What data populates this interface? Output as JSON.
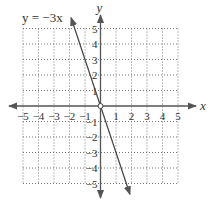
{
  "chart_data": {
    "type": "line",
    "title": "",
    "equation_label": "y = −3x",
    "xlabel": "x",
    "ylabel": "y",
    "xlim": [
      -5,
      5
    ],
    "ylim": [
      -5,
      5
    ],
    "grid": true,
    "grid_style": "dotted",
    "x_ticks": [
      -5,
      -4,
      -3,
      -2,
      -1,
      1,
      2,
      3,
      4,
      5
    ],
    "y_ticks": [
      5,
      4,
      3,
      2,
      1,
      -1,
      -2,
      -3,
      -4,
      -5
    ],
    "x_tick_labels": [
      "−5",
      "−4",
      "−3",
      "−2",
      "−1",
      "1",
      "2",
      "3",
      "4",
      "5"
    ],
    "y_tick_labels": [
      "5",
      "4",
      "3",
      "2",
      "1",
      "−1",
      "−2",
      "−3",
      "−4",
      "−5"
    ],
    "series": [
      {
        "name": "y = −3x",
        "slope": -3,
        "intercept": 0,
        "x": [
          -1.9,
          0,
          1.9
        ],
        "y": [
          5.7,
          0,
          -5.7
        ],
        "arrows_both_ends": true
      }
    ],
    "marked_points": [
      {
        "x": 0,
        "y": 0,
        "style": "open-circle"
      }
    ]
  },
  "colors": {
    "axis": "#555555",
    "grid": "#777777",
    "line": "#444444",
    "text": "#333333"
  }
}
